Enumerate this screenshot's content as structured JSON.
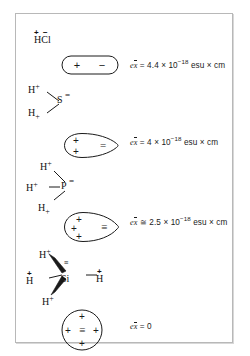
{
  "figure": {
    "type": "chemistry-dipole-diagram",
    "border_color": "#b8b8b8",
    "background": "#ffffff",
    "ink_color": "#1a1a1a"
  },
  "rows": [
    {
      "id": "hcl",
      "molecule": "HCl",
      "charge_marks": "+ −",
      "h_label": "H",
      "second_atom": "Cl",
      "shape": "capsule",
      "shape_marks": [
        "+",
        "−"
      ],
      "equation": {
        "lhs": "e",
        "variable": "x",
        "relation": "=",
        "coefficient": "4.4",
        "times": "×",
        "base": "10",
        "exponent": "−18",
        "units": "esu × cm",
        "full": "ex̄ = 4.4 × 10⁻¹⁸ esu × cm"
      }
    },
    {
      "id": "h2s",
      "molecule": "H2S",
      "atoms": [
        {
          "symbol": "H",
          "charge": "+",
          "charge_pos": "super"
        },
        {
          "symbol": "S",
          "lone_pairs": "="
        },
        {
          "symbol": "H",
          "charge": "+",
          "charge_pos": "sub"
        }
      ],
      "shape": "teardrop",
      "shape_marks": [
        "+",
        "+",
        "="
      ],
      "equation": {
        "lhs": "e",
        "variable": "x",
        "relation": "=",
        "coefficient": "4",
        "times": "×",
        "base": "10",
        "exponent": "−18",
        "units": "esu × cm",
        "full": "ex̄ = 4 × 10⁻¹⁸ esu × cm"
      }
    },
    {
      "id": "ph3",
      "molecule": "PH3",
      "atoms": [
        {
          "symbol": "H",
          "charge": "+",
          "charge_pos": "super"
        },
        {
          "symbol": "H",
          "charge": "+",
          "charge_pos": "super"
        },
        {
          "symbol": "P",
          "lone_pairs": "="
        },
        {
          "symbol": "H",
          "charge": "+",
          "charge_pos": "sub"
        }
      ],
      "shape": "teardrop",
      "shape_marks": [
        "+",
        "+",
        "+",
        "≡"
      ],
      "equation": {
        "lhs": "e",
        "variable": "x",
        "relation": "≅",
        "coefficient": "2.5",
        "times": "×",
        "base": "10",
        "exponent": "−18",
        "units": "esu × cm",
        "full": "ex̄ ≅ 2.5 × 10⁻¹⁸ esu × cm"
      }
    },
    {
      "id": "sih4",
      "molecule": "SiH4",
      "atoms": [
        {
          "symbol": "H",
          "charge": "+",
          "charge_pos": "super"
        },
        {
          "symbol": "H",
          "charge": "+",
          "charge_pos": "super-left"
        },
        {
          "symbol": "Si",
          "lone_pairs": "≡"
        },
        {
          "symbol": "H",
          "charge": "+",
          "charge_pos": "super-right"
        },
        {
          "symbol": "H",
          "charge": "+",
          "charge_pos": "super"
        }
      ],
      "shape": "circle",
      "shape_marks": [
        "+",
        "+",
        "+",
        "+",
        "≡"
      ],
      "equation": {
        "lhs": "e",
        "variable": "x",
        "relation": "=",
        "coefficient": "0",
        "times": "",
        "base": "",
        "exponent": "",
        "units": "",
        "full": "ex̄ = 0"
      }
    }
  ],
  "glyphs": {
    "plus": "+",
    "minus": "−",
    "equal_bars": "=",
    "triple_bars": "≡",
    "si": "Si",
    "p": "P",
    "s": "S",
    "h": "H",
    "cl": "Cl"
  }
}
